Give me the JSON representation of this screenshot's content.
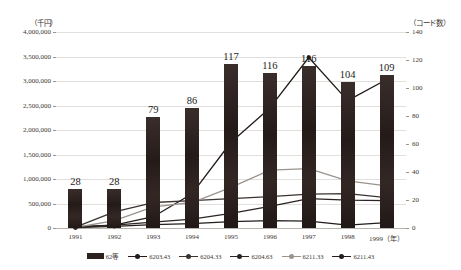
{
  "axes": {
    "left_unit": "（千円）",
    "right_unit": "（コード数）",
    "x_unit_suffix": "（年）",
    "left_ticks": [
      "4,000,000",
      "3,500,000",
      "3,000,000",
      "2,500,000",
      "2,000,000",
      "1,500,000",
      "1,000,000",
      "500,000",
      "0"
    ],
    "right_ticks": [
      "140",
      "120",
      "100",
      "80",
      "60",
      "40",
      "20",
      "0"
    ]
  },
  "chart_data": {
    "type": "bar",
    "title": "",
    "xlabel": "（年）",
    "ylabel": "（千円）",
    "y2label": "（コード数）",
    "ylim": [
      0,
      4000000
    ],
    "y2lim": [
      0,
      140
    ],
    "grid": true,
    "legend_position": "bottom",
    "categories": [
      "1991",
      "1992",
      "1993",
      "1994",
      "1995",
      "1996",
      "1997",
      "1998",
      "1999"
    ],
    "bar_series": {
      "name": "62等",
      "axis": "right",
      "values": [
        28,
        28,
        79,
        86,
        117,
        111,
        116,
        104,
        109
      ],
      "labels": [
        "28",
        "28",
        "79",
        "86",
        "117",
        "116",
        "116",
        "104",
        "109"
      ],
      "color": "#2c2220"
    },
    "series": [
      {
        "name": "62等",
        "type": "bar",
        "axis": "right",
        "values": [
          28,
          28,
          79,
          86,
          117,
          111,
          116,
          104,
          109
        ]
      },
      {
        "name": "6203.43",
        "type": "line",
        "axis": "left",
        "color": "#221b19",
        "values": [
          30000,
          60000,
          230000,
          700000,
          1750000,
          2450000,
          3480000,
          2600000,
          3030000
        ]
      },
      {
        "name": "6204.33",
        "type": "line",
        "axis": "left",
        "color": "#3a3330",
        "values": [
          20000,
          330000,
          520000,
          560000,
          600000,
          640000,
          690000,
          700000,
          620000
        ]
      },
      {
        "name": "6204.63",
        "type": "line",
        "axis": "left",
        "color": "#2b2422",
        "values": [
          15000,
          60000,
          120000,
          180000,
          300000,
          440000,
          600000,
          570000,
          560000
        ]
      },
      {
        "name": "6211.33",
        "type": "line",
        "axis": "left",
        "color": "#9a938e",
        "values": [
          10000,
          150000,
          430000,
          520000,
          830000,
          1180000,
          1210000,
          960000,
          860000
        ]
      },
      {
        "name": "6211.43",
        "type": "line",
        "axis": "left",
        "color": "#241d1b",
        "values": [
          8000,
          35000,
          70000,
          90000,
          130000,
          150000,
          140000,
          60000,
          110000
        ]
      }
    ]
  },
  "legend": [
    {
      "label": "62等",
      "marker": "bar",
      "color": "#2c2220"
    },
    {
      "label": "6203.43",
      "marker": "line",
      "color": "#221b19"
    },
    {
      "label": "6204.33",
      "marker": "line",
      "color": "#3a3330"
    },
    {
      "label": "6204.63",
      "marker": "line",
      "color": "#2b2422"
    },
    {
      "label": "6211.33",
      "marker": "line",
      "color": "#9a938e"
    },
    {
      "label": "6211.43",
      "marker": "line",
      "color": "#241d1b"
    }
  ]
}
